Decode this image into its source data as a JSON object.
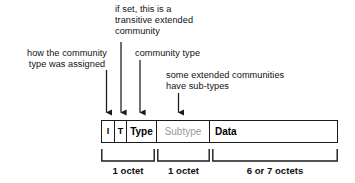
{
  "diagram": {
    "annotations": [
      {
        "id": "transitive",
        "text": "if set, this is a\ntransitive extended\ncommunity"
      },
      {
        "id": "assigned",
        "text": "how the community\ntype was assigned"
      },
      {
        "id": "commtype",
        "text": "community type"
      },
      {
        "id": "subtypes",
        "text": "some extended communities\nhave sub-types"
      }
    ],
    "fields": [
      {
        "id": "i",
        "label": "I",
        "muted": false
      },
      {
        "id": "t",
        "label": "T",
        "muted": false
      },
      {
        "id": "type",
        "label": "Type",
        "muted": false
      },
      {
        "id": "subtype",
        "label": "Subtype",
        "muted": true
      },
      {
        "id": "data",
        "label": "Data",
        "muted": false
      }
    ],
    "size_captions": [
      {
        "id": "octet-0",
        "text": "1 octet"
      },
      {
        "id": "octet-1",
        "text": "1 octet"
      },
      {
        "id": "octet-2",
        "text": "6 or 7 octets"
      }
    ],
    "colors": {
      "stroke": "#1a1a1a",
      "background": "#ffffff",
      "text": "#111111",
      "muted_text": "#9a9a9a"
    }
  }
}
